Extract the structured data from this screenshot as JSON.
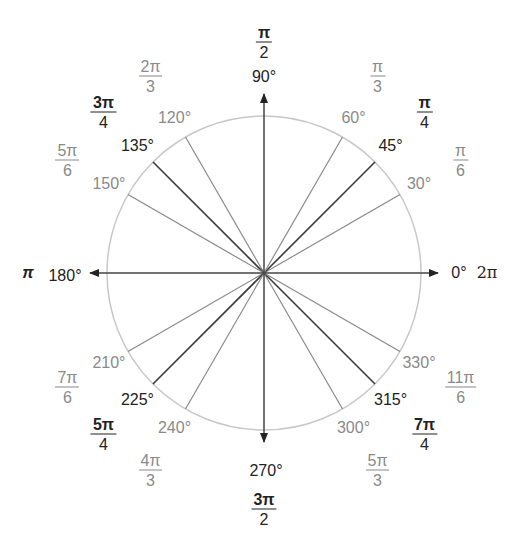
{
  "diagram": {
    "type": "unit-circle-angle-diagram",
    "center": [
      264,
      273
    ],
    "radius": 157,
    "colors": {
      "primary": "#222222",
      "secondary": "#8a8a8a",
      "circle": "#c8c8c8"
    },
    "axes": {
      "right": {
        "degree": "0°",
        "radian": "2π"
      },
      "up": {
        "degree": "90°",
        "radian_num": "π",
        "radian_den": "2"
      },
      "left": {
        "degree": "180°",
        "radian": "π"
      },
      "down": {
        "degree": "270°",
        "radian_num": "3π",
        "radian_den": "2"
      }
    },
    "angles": [
      {
        "deg": 30,
        "degree": "30°",
        "num": "π",
        "den": "6",
        "style": "gray"
      },
      {
        "deg": 45,
        "degree": "45°",
        "num": "π",
        "den": "4",
        "style": "dark"
      },
      {
        "deg": 60,
        "degree": "60°",
        "num": "π",
        "den": "3",
        "style": "gray"
      },
      {
        "deg": 120,
        "degree": "120°",
        "num": "2π",
        "den": "3",
        "style": "gray"
      },
      {
        "deg": 135,
        "degree": "135°",
        "num": "3π",
        "den": "4",
        "style": "dark"
      },
      {
        "deg": 150,
        "degree": "150°",
        "num": "5π",
        "den": "6",
        "style": "gray"
      },
      {
        "deg": 210,
        "degree": "210°",
        "num": "7π",
        "den": "6",
        "style": "gray"
      },
      {
        "deg": 225,
        "degree": "225°",
        "num": "5π",
        "den": "4",
        "style": "dark"
      },
      {
        "deg": 240,
        "degree": "240°",
        "num": "4π",
        "den": "3",
        "style": "gray"
      },
      {
        "deg": 300,
        "degree": "300°",
        "num": "5π",
        "den": "3",
        "style": "gray"
      },
      {
        "deg": 315,
        "degree": "315°",
        "num": "7π",
        "den": "4",
        "style": "dark"
      },
      {
        "deg": 330,
        "degree": "330°",
        "num": "11π",
        "den": "6",
        "style": "gray"
      }
    ]
  }
}
